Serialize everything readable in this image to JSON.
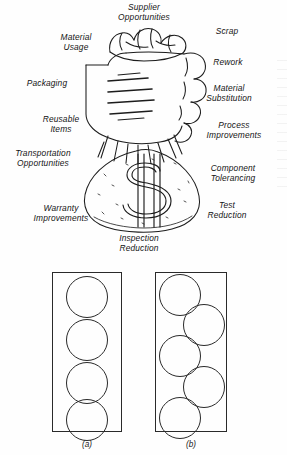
{
  "figure_moneybag": {
    "illustration_name": "hand-gripping-money-bag",
    "bag_symbol": "$",
    "labels": [
      {
        "id": "supplier-opportunities",
        "text": "Supplier\nOpportunities",
        "align": "center"
      },
      {
        "id": "scrap",
        "text": "Scrap",
        "align": "center"
      },
      {
        "id": "material-usage",
        "text": "Material\nUsage",
        "align": "center"
      },
      {
        "id": "rework",
        "text": "Rework",
        "align": "center"
      },
      {
        "id": "packaging",
        "text": "Packaging",
        "align": "center"
      },
      {
        "id": "material-substitution",
        "text": "Material\nSubstitution",
        "align": "center"
      },
      {
        "id": "reusable-items",
        "text": "Reusable\nItems",
        "align": "center"
      },
      {
        "id": "process-improvements",
        "text": "Process\nImprovements",
        "align": "center"
      },
      {
        "id": "transportation-opportunities",
        "text": "Transportation\nOpportunities",
        "align": "center"
      },
      {
        "id": "component-tolerancing",
        "text": "Component\nTolerancing",
        "align": "center"
      },
      {
        "id": "warranty-improvements",
        "text": "Warranty\nImprovements",
        "align": "center"
      },
      {
        "id": "test-reduction",
        "text": "Test\nReduction",
        "align": "center"
      },
      {
        "id": "inspection-reduction",
        "text": "Inspection\nReduction",
        "align": "center"
      }
    ]
  },
  "figure_packing": {
    "panels": [
      {
        "id": "panel-a",
        "caption": "(a)",
        "box": {
          "width": 68,
          "height": 158
        },
        "circle_count": 4,
        "arrangement": "single-column",
        "circles": [
          {
            "cx": 34,
            "cy": 24,
            "r": 21
          },
          {
            "cx": 34,
            "cy": 67,
            "r": 21
          },
          {
            "cx": 34,
            "cy": 110,
            "r": 21
          },
          {
            "cx": 34,
            "cy": 147,
            "r": 21
          }
        ]
      },
      {
        "id": "panel-b",
        "caption": "(b)",
        "box": {
          "width": 70,
          "height": 158
        },
        "circle_count": 5,
        "arrangement": "staggered",
        "circles": [
          {
            "cx": 24,
            "cy": 22,
            "r": 21
          },
          {
            "cx": 48,
            "cy": 52,
            "r": 21
          },
          {
            "cx": 24,
            "cy": 83,
            "r": 21
          },
          {
            "cx": 48,
            "cy": 114,
            "r": 21
          },
          {
            "cx": 24,
            "cy": 145,
            "r": 21
          }
        ]
      }
    ]
  },
  "colors": {
    "ink": "#1a1a1a",
    "line": "#2a2a2a",
    "paper": "#fefefe"
  }
}
